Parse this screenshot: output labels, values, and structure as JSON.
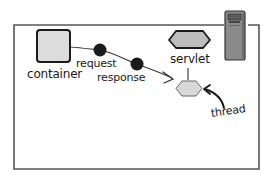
{
  "diagram": {
    "nodes": {
      "container": {
        "label": "container"
      },
      "request": {
        "label": "request"
      },
      "response": {
        "label": "response"
      },
      "servlet": {
        "label": "servlet"
      },
      "thread": {
        "label": "thread"
      },
      "server": {
        "label": ""
      }
    },
    "colors": {
      "frame": "#555555",
      "container_fill": "#dcdcdc",
      "dot_fill": "#1a1a1a",
      "hex_fill": "#bdbdbd",
      "thread_hex_fill": "#d8d8d8",
      "server_fill": "#8a8a8a",
      "ink": "#1a1a1a"
    }
  }
}
